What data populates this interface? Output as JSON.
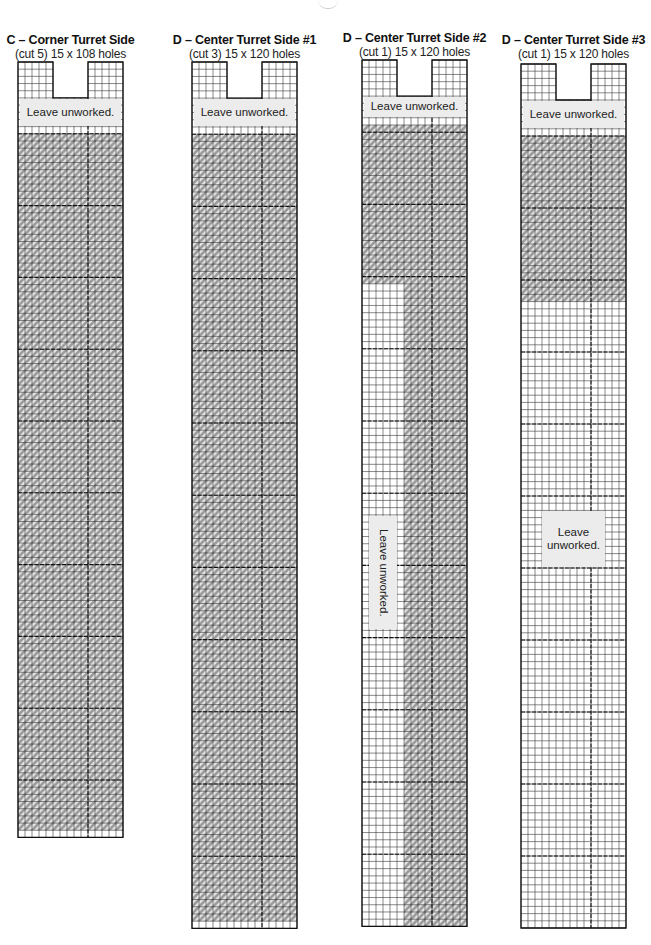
{
  "page": {
    "background": "#ffffff"
  },
  "legend_colors": {
    "stitch_fill": "#9a9a9a",
    "grid_line": "#222222",
    "label_bg": "#ececec"
  },
  "pieces": [
    {
      "id": "C",
      "title": "C – Corner Turret Side",
      "subtitle": "(cut 5) 15 x 108 holes",
      "cols": 15,
      "rows": 108,
      "left": 18,
      "top": 62,
      "cell_w": 7.0,
      "cell_h": 7.18,
      "title_top": 33,
      "sub_top": 47,
      "notch": {
        "col_start": 5,
        "col_end": 10,
        "rows": 5
      },
      "stitch_regions": [
        {
          "c0": 0,
          "c1": 15,
          "r0": 10,
          "r1": 107
        }
      ],
      "labels": [
        {
          "text": "Leave unworked.",
          "c0": 0,
          "c1": 15,
          "r0": 5,
          "r1": 9,
          "vertical": false
        }
      ]
    },
    {
      "id": "D1",
      "title": "D – Center Turret Side #1",
      "subtitle": "(cut 3) 15 x 120 holes",
      "cols": 15,
      "rows": 120,
      "left": 192,
      "top": 62,
      "cell_w": 7.0,
      "cell_h": 7.22,
      "title_top": 33,
      "sub_top": 47,
      "notch": {
        "col_start": 5,
        "col_end": 10,
        "rows": 5
      },
      "stitch_regions": [
        {
          "c0": 0,
          "c1": 15,
          "r0": 10,
          "r1": 119
        }
      ],
      "labels": [
        {
          "text": "Leave unworked.",
          "c0": 0,
          "c1": 15,
          "r0": 5,
          "r1": 9,
          "vertical": false
        }
      ]
    },
    {
      "id": "D2",
      "title": "D – Center Turret Side #2",
      "subtitle": "(cut 1) 15 x 120 holes",
      "cols": 15,
      "rows": 120,
      "left": 362,
      "top": 60,
      "cell_w": 7.0,
      "cell_h": 7.22,
      "title_top": 31,
      "sub_top": 45,
      "notch": {
        "col_start": 5,
        "col_end": 10,
        "rows": 5
      },
      "stitch_regions": [
        {
          "c0": 0,
          "c1": 15,
          "r0": 9,
          "r1": 31
        },
        {
          "c0": 6,
          "c1": 15,
          "r0": 31,
          "r1": 120
        }
      ],
      "labels": [
        {
          "text": "Leave unworked.",
          "c0": 0,
          "c1": 15,
          "r0": 5,
          "r1": 8,
          "vertical": false
        },
        {
          "text": "Leave unworked.",
          "c0": 1,
          "c1": 5,
          "r0": 63,
          "r1": 79,
          "vertical": true
        }
      ]
    },
    {
      "id": "D3",
      "title": "D – Center Turret Side #3",
      "subtitle": "(cut 1) 15 x 120 holes",
      "cols": 15,
      "rows": 120,
      "left": 521,
      "top": 64,
      "cell_w": 7.0,
      "cell_h": 7.2,
      "title_top": 33,
      "sub_top": 47,
      "notch": {
        "col_start": 5,
        "col_end": 10,
        "rows": 5
      },
      "stitch_regions": [
        {
          "c0": 0,
          "c1": 15,
          "r0": 10,
          "r1": 33
        }
      ],
      "labels": [
        {
          "text": "Leave unworked.",
          "c0": 0,
          "c1": 15,
          "r0": 5,
          "r1": 9,
          "vertical": false
        },
        {
          "text": "Leave\nunworked.",
          "c0": 3,
          "c1": 12,
          "r0": 62,
          "r1": 70,
          "vertical": false
        }
      ]
    }
  ]
}
